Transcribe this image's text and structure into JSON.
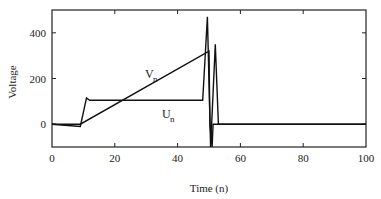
{
  "chart_data": {
    "type": "line",
    "title": "",
    "xlabel": "Time (n)",
    "ylabel": "Voltage",
    "xlim": [
      0,
      100
    ],
    "ylim": [
      -100,
      500
    ],
    "xticks": [
      0,
      20,
      40,
      60,
      80,
      100
    ],
    "yticks": [
      0,
      200,
      400
    ],
    "grid": false,
    "legend": "inline labels",
    "series": [
      {
        "name": "V_n",
        "label_main": "V",
        "label_sub": "n",
        "x": [
          0,
          9,
          50,
          50.3,
          51,
          51.3,
          100
        ],
        "y": [
          0,
          0,
          320,
          0,
          -100,
          0,
          0
        ]
      },
      {
        "name": "U_n",
        "label_main": "U",
        "label_sub": "n",
        "x": [
          0,
          9,
          11,
          12,
          48,
          49.5,
          50.5,
          52,
          53,
          100
        ],
        "y": [
          0,
          -10,
          115,
          105,
          105,
          470,
          -100,
          350,
          0,
          0
        ]
      }
    ]
  }
}
